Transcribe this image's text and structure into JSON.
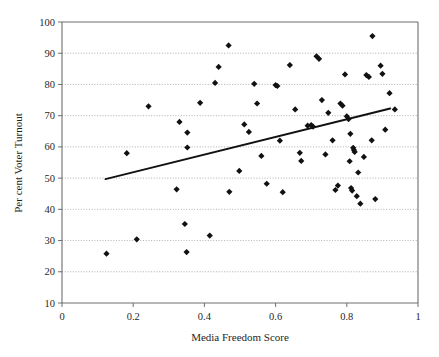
{
  "chart_data": {
    "type": "scatter",
    "title": "",
    "xlabel": "Media Freedom Score",
    "ylabel": "Per cent Voter Turnout",
    "xlim": [
      0,
      1
    ],
    "ylim": [
      10,
      100
    ],
    "xticks": [
      "0",
      "0.2",
      "0.4",
      "0.6",
      "0.8",
      "1"
    ],
    "xtick_values": [
      0,
      0.2,
      0.4,
      0.6,
      0.8,
      1
    ],
    "yticks": [
      "10",
      "20",
      "30",
      "40",
      "50",
      "60",
      "70",
      "80",
      "90",
      "100"
    ],
    "ytick_values": [
      10,
      20,
      30,
      40,
      50,
      60,
      70,
      80,
      90,
      100
    ],
    "grid": "horizontal-dotted",
    "legend": "none",
    "marker": "filled-diamond",
    "marker_color": "#111111",
    "points": [
      {
        "x": 0.125,
        "y": 25.8
      },
      {
        "x": 0.182,
        "y": 58.0
      },
      {
        "x": 0.21,
        "y": 30.4
      },
      {
        "x": 0.243,
        "y": 73.0
      },
      {
        "x": 0.322,
        "y": 46.4
      },
      {
        "x": 0.33,
        "y": 68.0
      },
      {
        "x": 0.345,
        "y": 35.3
      },
      {
        "x": 0.35,
        "y": 26.3
      },
      {
        "x": 0.352,
        "y": 64.6
      },
      {
        "x": 0.352,
        "y": 59.8
      },
      {
        "x": 0.388,
        "y": 74.1
      },
      {
        "x": 0.415,
        "y": 31.6
      },
      {
        "x": 0.43,
        "y": 80.5
      },
      {
        "x": 0.44,
        "y": 85.6
      },
      {
        "x": 0.468,
        "y": 92.5
      },
      {
        "x": 0.47,
        "y": 45.6
      },
      {
        "x": 0.498,
        "y": 52.3
      },
      {
        "x": 0.512,
        "y": 67.2
      },
      {
        "x": 0.525,
        "y": 64.8
      },
      {
        "x": 0.54,
        "y": 80.2
      },
      {
        "x": 0.548,
        "y": 73.9
      },
      {
        "x": 0.56,
        "y": 57.1
      },
      {
        "x": 0.575,
        "y": 48.2
      },
      {
        "x": 0.6,
        "y": 79.8
      },
      {
        "x": 0.605,
        "y": 79.5
      },
      {
        "x": 0.612,
        "y": 62.0
      },
      {
        "x": 0.62,
        "y": 45.5
      },
      {
        "x": 0.64,
        "y": 86.2
      },
      {
        "x": 0.655,
        "y": 72.0
      },
      {
        "x": 0.668,
        "y": 58.1
      },
      {
        "x": 0.672,
        "y": 55.5
      },
      {
        "x": 0.69,
        "y": 66.8
      },
      {
        "x": 0.7,
        "y": 67.0
      },
      {
        "x": 0.705,
        "y": 66.5
      },
      {
        "x": 0.715,
        "y": 89.0
      },
      {
        "x": 0.722,
        "y": 88.2
      },
      {
        "x": 0.73,
        "y": 75.0
      },
      {
        "x": 0.74,
        "y": 57.6
      },
      {
        "x": 0.748,
        "y": 70.9
      },
      {
        "x": 0.76,
        "y": 62.1
      },
      {
        "x": 0.768,
        "y": 46.2
      },
      {
        "x": 0.775,
        "y": 47.6
      },
      {
        "x": 0.782,
        "y": 73.9
      },
      {
        "x": 0.788,
        "y": 73.2
      },
      {
        "x": 0.795,
        "y": 83.2
      },
      {
        "x": 0.8,
        "y": 69.8
      },
      {
        "x": 0.805,
        "y": 68.9
      },
      {
        "x": 0.808,
        "y": 55.4
      },
      {
        "x": 0.81,
        "y": 64.2
      },
      {
        "x": 0.812,
        "y": 46.8
      },
      {
        "x": 0.815,
        "y": 46.0
      },
      {
        "x": 0.818,
        "y": 59.7
      },
      {
        "x": 0.82,
        "y": 59.0
      },
      {
        "x": 0.822,
        "y": 58.4
      },
      {
        "x": 0.828,
        "y": 44.2
      },
      {
        "x": 0.832,
        "y": 51.8
      },
      {
        "x": 0.838,
        "y": 41.8
      },
      {
        "x": 0.848,
        "y": 56.8
      },
      {
        "x": 0.855,
        "y": 83.0
      },
      {
        "x": 0.862,
        "y": 82.4
      },
      {
        "x": 0.87,
        "y": 62.1
      },
      {
        "x": 0.872,
        "y": 95.5
      },
      {
        "x": 0.88,
        "y": 43.3
      },
      {
        "x": 0.895,
        "y": 86.0
      },
      {
        "x": 0.9,
        "y": 83.4
      },
      {
        "x": 0.908,
        "y": 65.5
      },
      {
        "x": 0.92,
        "y": 77.2
      },
      {
        "x": 0.935,
        "y": 72.0
      }
    ],
    "trendline": {
      "type": "linear-fit",
      "x_start": 0.122,
      "y_start": 49.7,
      "x_end": 0.922,
      "y_end": 72.3
    }
  }
}
